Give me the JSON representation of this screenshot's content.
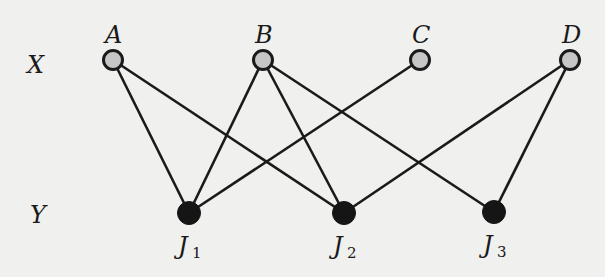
{
  "diagram": {
    "type": "bipartite-graph",
    "partitions": [
      {
        "id": "X",
        "label": "X",
        "label_pos": [
          35,
          73
        ],
        "node_style": "gray-filled"
      },
      {
        "id": "Y",
        "label": "Y",
        "label_pos": [
          38,
          223
        ],
        "node_style": "black-filled"
      }
    ],
    "nodes": [
      {
        "id": "A",
        "label": "A",
        "sub": "",
        "partition": "X",
        "x": 113,
        "y": 60
      },
      {
        "id": "B",
        "label": "B",
        "sub": "",
        "partition": "X",
        "x": 263,
        "y": 60
      },
      {
        "id": "C",
        "label": "C",
        "sub": "",
        "partition": "X",
        "x": 420,
        "y": 60
      },
      {
        "id": "D",
        "label": "D",
        "sub": "",
        "partition": "X",
        "x": 570,
        "y": 60
      },
      {
        "id": "J1",
        "label": "J",
        "sub": "1",
        "partition": "Y",
        "x": 189,
        "y": 213
      },
      {
        "id": "J2",
        "label": "J",
        "sub": "2",
        "partition": "Y",
        "x": 344,
        "y": 213
      },
      {
        "id": "J3",
        "label": "J",
        "sub": "3",
        "partition": "Y",
        "x": 494,
        "y": 212
      }
    ],
    "edges": [
      [
        "A",
        "J1"
      ],
      [
        "A",
        "J2"
      ],
      [
        "B",
        "J1"
      ],
      [
        "B",
        "J2"
      ],
      [
        "B",
        "J3"
      ],
      [
        "C",
        "J1"
      ],
      [
        "D",
        "J2"
      ],
      [
        "D",
        "J3"
      ]
    ],
    "colors": {
      "x_node_fill": "#c6c6c6",
      "y_node_fill": "#151515",
      "stroke": "#1a1a1a",
      "background": "#f0f0ee"
    }
  }
}
